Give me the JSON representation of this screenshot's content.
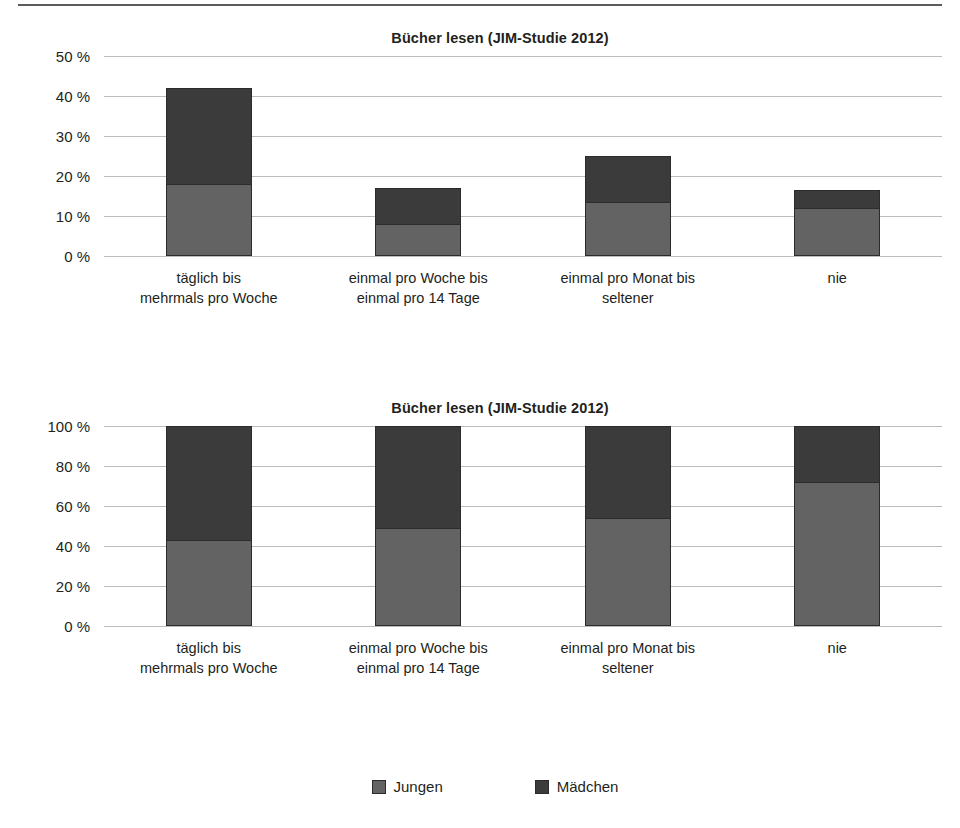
{
  "colors": {
    "jungen": "#636363",
    "maedchen": "#3b3b3b",
    "grid": "#bcbcbc",
    "text": "#231f20"
  },
  "legend": {
    "position": "bottom-center",
    "items": [
      {
        "label": "Jungen",
        "color": "#636363",
        "swatch": "legend-swatch-jungen"
      },
      {
        "label": "Mädchen",
        "color": "#3b3b3b",
        "swatch": "legend-swatch-maedchen"
      }
    ]
  },
  "categories": [
    "täglich bis\nmehrmals pro Woche",
    "einmal pro Woche bis\neinmal pro 14 Tage",
    "einmal pro Monat bis\nseltener",
    "nie"
  ],
  "category_lines": [
    [
      "täglich bis",
      "mehrmals pro Woche"
    ],
    [
      "einmal pro Woche bis",
      "einmal pro 14 Tage"
    ],
    [
      "einmal pro Monat bis",
      "seltener"
    ],
    [
      "nie",
      ""
    ]
  ],
  "charts": [
    {
      "title": "Bücher lesen (JIM-Studie 2012)",
      "yticks": [
        "50 %",
        "40 %",
        "30 %",
        "20 %",
        "10 %",
        "0 %"
      ]
    },
    {
      "title": "Bücher lesen (JIM-Studie 2012)",
      "yticks": [
        "100 %",
        "80 %",
        "60 %",
        "40 %",
        "20 %",
        "0 %"
      ]
    }
  ],
  "chart_data": [
    {
      "type": "bar",
      "stacked": true,
      "title": "Bücher lesen (JIM-Studie 2012)",
      "xlabel": "",
      "ylabel": "",
      "ylim": [
        0,
        50
      ],
      "ytick_values": [
        0,
        10,
        20,
        30,
        40,
        50
      ],
      "ytick_labels": [
        "0 %",
        "10 %",
        "20 %",
        "30 %",
        "40 %",
        "50 %"
      ],
      "grid": true,
      "legend_position": "bottom-center",
      "categories": [
        "täglich bis mehrmals pro Woche",
        "einmal pro Woche bis einmal pro 14 Tage",
        "einmal pro Monat bis seltener",
        "nie"
      ],
      "series": [
        {
          "name": "Jungen",
          "color": "#636363",
          "values": [
            18,
            8,
            13.5,
            12
          ]
        },
        {
          "name": "Mädchen",
          "color": "#3b3b3b",
          "values": [
            24,
            9,
            11.5,
            4.5
          ]
        }
      ],
      "totals": [
        42,
        17,
        25,
        16.5
      ]
    },
    {
      "type": "bar",
      "stacked": true,
      "normalized": true,
      "title": "Bücher lesen (JIM-Studie 2012)",
      "xlabel": "",
      "ylabel": "",
      "ylim": [
        0,
        100
      ],
      "ytick_values": [
        0,
        20,
        40,
        60,
        80,
        100
      ],
      "ytick_labels": [
        "0 %",
        "20 %",
        "40 %",
        "60 %",
        "80 %",
        "100 %"
      ],
      "grid": true,
      "legend_position": "bottom-center",
      "categories": [
        "täglich bis mehrmals pro Woche",
        "einmal pro Woche bis einmal pro 14 Tage",
        "einmal pro Monat bis seltener",
        "nie"
      ],
      "series": [
        {
          "name": "Jungen",
          "color": "#636363",
          "values": [
            43,
            49,
            54,
            72
          ]
        },
        {
          "name": "Mädchen",
          "color": "#3b3b3b",
          "values": [
            57,
            51,
            46,
            28
          ]
        }
      ],
      "totals": [
        100,
        100,
        100,
        100
      ]
    }
  ]
}
